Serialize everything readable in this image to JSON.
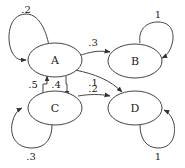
{
  "diagram": {
    "type": "markov-chain",
    "nodes": [
      {
        "id": "A",
        "label": "A"
      },
      {
        "id": "B",
        "label": "B"
      },
      {
        "id": "C",
        "label": "C"
      },
      {
        "id": "D",
        "label": "D"
      }
    ],
    "edges": [
      {
        "from": "A",
        "to": "A",
        "label": ".2"
      },
      {
        "from": "A",
        "to": "B",
        "label": ".3"
      },
      {
        "from": "A",
        "to": "C",
        "label": ".4"
      },
      {
        "from": "A",
        "to": "D",
        "label": ".1"
      },
      {
        "from": "B",
        "to": "B",
        "label": "1"
      },
      {
        "from": "C",
        "to": "A",
        "label": ".5"
      },
      {
        "from": "C",
        "to": "C",
        "label": ".3"
      },
      {
        "from": "C",
        "to": "D",
        "label": ".2"
      },
      {
        "from": "D",
        "to": "D",
        "label": "1"
      }
    ]
  }
}
